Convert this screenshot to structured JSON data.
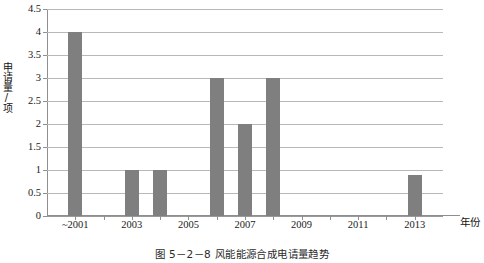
{
  "chart_data": {
    "type": "bar",
    "title": "",
    "xlabel": "年份",
    "ylabel": "申请量/项",
    "ylim": [
      0,
      4.5
    ],
    "ytick_labels": [
      "0",
      "0.5",
      "1",
      "1.5",
      "2",
      "2.5",
      "3",
      "3.5",
      "4",
      "4.5"
    ],
    "ytick_values": [
      0,
      0.5,
      1,
      1.5,
      2,
      2.5,
      3,
      3.5,
      4,
      4.5
    ],
    "xtick_labels": [
      "~2001",
      "2003",
      "2005",
      "2007",
      "2009",
      "2011",
      "2013"
    ],
    "xtick_values": [
      2001,
      2003,
      2005,
      2007,
      2009,
      2011,
      2013
    ],
    "x_axis_min": 2000,
    "x_axis_max": 2014,
    "grid": true,
    "grid_axis": "y",
    "legend": false,
    "bar_color": "#7f7f7f",
    "categories": [
      "~2001",
      "2002",
      "2003",
      "2004",
      "2005",
      "2006",
      "2007",
      "2008",
      "2009",
      "2010",
      "2011",
      "2012",
      "2013"
    ],
    "values": [
      4,
      0,
      1,
      1,
      0,
      3,
      2,
      3,
      0,
      0,
      0,
      0,
      0.9
    ],
    "bars": [
      {
        "year": 2001,
        "label": "~2001",
        "value": 4
      },
      {
        "year": 2003,
        "label": "2003",
        "value": 1
      },
      {
        "year": 2004,
        "label": "2004",
        "value": 1
      },
      {
        "year": 2006,
        "label": "2006",
        "value": 3
      },
      {
        "year": 2007,
        "label": "2007",
        "value": 2
      },
      {
        "year": 2008,
        "label": "2008",
        "value": 3
      },
      {
        "year": 2013,
        "label": "2013",
        "value": 0.9
      }
    ]
  },
  "caption": {
    "text": "图 5－2－8  风能能源合成电请量趋势"
  }
}
